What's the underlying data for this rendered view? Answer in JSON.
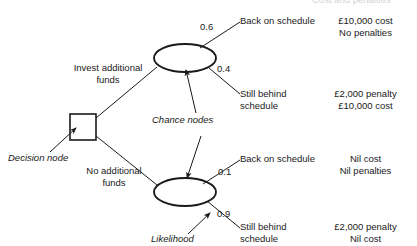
{
  "diagram": {
    "title_header": "Cost and penalties",
    "nodes": {
      "decision": {
        "label": "Decision node",
        "shape": "square"
      },
      "chance": {
        "label": "Chance nodes",
        "shape": "ellipse"
      },
      "likelihood": {
        "label": "Likelihood"
      }
    },
    "branches": [
      {
        "label_line1": "Invest additional",
        "label_line2": "funds"
      },
      {
        "label_line1": "No additional",
        "label_line2": "funds"
      }
    ],
    "outcomes": [
      {
        "probability": "0.6",
        "outcome_line1": "Back on schedule",
        "outcome_line2": "",
        "result_line1": "£10,000 cost",
        "result_line2": "No penalties"
      },
      {
        "probability": "0.4",
        "outcome_line1": "Still behind",
        "outcome_line2": "schedule",
        "result_line1": "£2,000 penalty",
        "result_line2": "£10,000 cost"
      },
      {
        "probability": "0.1",
        "outcome_line1": "Back on schedule",
        "outcome_line2": "",
        "result_line1": "Nil cost",
        "result_line2": "Nil penalties"
      },
      {
        "probability": "0.9",
        "outcome_line1": "Still behind",
        "outcome_line2": "schedule",
        "result_line1": "£2,000  penalty",
        "result_line2": "Nil cost"
      }
    ],
    "colors": {
      "ink": "#1a1a1a",
      "background": "#ffffff"
    }
  }
}
